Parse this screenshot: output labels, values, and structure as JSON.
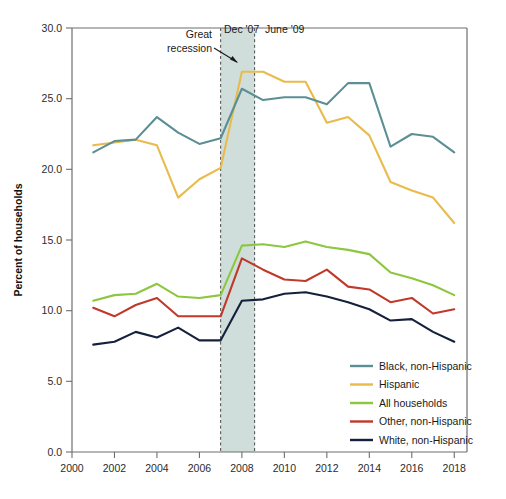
{
  "chart_data": {
    "type": "line",
    "title": "",
    "xlabel": "",
    "ylabel": "Percent of households",
    "xlim": [
      2000,
      2018.6
    ],
    "ylim": [
      0.0,
      30.0
    ],
    "grid": false,
    "legend_position": "lower right",
    "x": [
      2001,
      2002,
      2003,
      2004,
      2005,
      2006,
      2007,
      2008,
      2009,
      2010,
      2011,
      2012,
      2013,
      2014,
      2015,
      2016,
      2017,
      2018
    ],
    "xticks": [
      "2000",
      "2002",
      "2004",
      "2006",
      "2008",
      "2010",
      "2012",
      "2014",
      "2016",
      "2018"
    ],
    "yticks": [
      "0.0",
      "5.0",
      "10.0",
      "15.0",
      "20.0",
      "25.0",
      "30.0"
    ],
    "series": [
      {
        "name": "Black, non-Hispanic",
        "color": "#5b8f95",
        "values": [
          21.2,
          22.0,
          22.1,
          23.7,
          22.6,
          21.8,
          22.2,
          25.7,
          24.9,
          25.1,
          25.1,
          24.6,
          26.1,
          26.1,
          21.6,
          22.5,
          22.3,
          21.2
        ]
      },
      {
        "name": "Hispanic",
        "color": "#e9bb4d",
        "values": [
          21.7,
          21.9,
          22.1,
          21.7,
          18.0,
          19.3,
          20.1,
          26.9,
          26.9,
          26.2,
          26.2,
          23.3,
          23.7,
          22.4,
          19.1,
          18.5,
          18.0,
          16.2
        ]
      },
      {
        "name": "All households",
        "color": "#8dc63f",
        "values": [
          10.7,
          11.1,
          11.2,
          11.9,
          11.0,
          10.9,
          11.1,
          14.6,
          14.7,
          14.5,
          14.9,
          14.5,
          14.3,
          14.0,
          12.7,
          12.3,
          11.8,
          11.1
        ]
      },
      {
        "name": "Other, non-Hispanic",
        "color": "#c0392b",
        "values": [
          10.2,
          9.6,
          10.4,
          10.9,
          9.6,
          9.6,
          9.6,
          13.7,
          12.9,
          12.2,
          12.1,
          12.9,
          11.7,
          11.5,
          10.6,
          10.9,
          9.8,
          10.1
        ]
      },
      {
        "name": "White, non-Hispanic",
        "color": "#14203c",
        "values": [
          7.6,
          7.8,
          8.5,
          8.1,
          8.8,
          7.9,
          7.9,
          10.7,
          10.8,
          11.2,
          11.3,
          11.0,
          10.6,
          10.1,
          9.3,
          9.4,
          8.5,
          7.8
        ]
      }
    ],
    "annotations": [
      {
        "name": "great-recession",
        "text": "Great\nrecession",
        "line1": "Great",
        "line2": "recession"
      },
      {
        "name": "recession-start",
        "text": "Dec '07",
        "x": 2007.0
      },
      {
        "name": "recession-end",
        "text": "June '09",
        "x": 2008.6
      }
    ],
    "shaded_band": {
      "from": 2007.0,
      "to": 2008.6,
      "color": "#cfdeda"
    }
  }
}
